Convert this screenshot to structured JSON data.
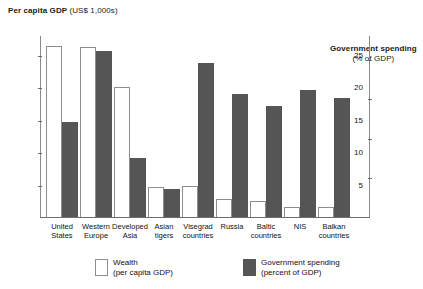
{
  "chart_data": {
    "type": "bar",
    "title": "",
    "categories": [
      "United States",
      "Western Europe",
      "Developed Asia",
      "Asian tigers",
      "Visegrad countries",
      "Russia",
      "Baltic countries",
      "NIS",
      "Balkan countries"
    ],
    "category_lines": [
      [
        "United",
        "States"
      ],
      [
        "Western",
        "Europe"
      ],
      [
        "Developed",
        "Asia"
      ],
      [
        "Asian",
        "tigers"
      ],
      [
        "Visegrad",
        "countries"
      ],
      [
        "Russia",
        ""
      ],
      [
        "Baltic",
        "countries"
      ],
      [
        "NIS",
        ""
      ],
      [
        "Balkan",
        "countries"
      ]
    ],
    "series": [
      {
        "name": "Wealth (per capita GDP)",
        "axis": "left",
        "color": "#ffffff",
        "values": [
          26.3,
          26.2,
          20.0,
          4.6,
          4.7,
          2.8,
          2.5,
          1.5,
          1.6
        ]
      },
      {
        "name": "Government spending (percent of GDP)",
        "axis": "right",
        "color": "#555555",
        "values": [
          34.0,
          52.0,
          25.0,
          17.0,
          49.0,
          41.0,
          38.0,
          42.0,
          40.0
        ]
      }
    ],
    "left_axis": {
      "label_line1": "Per capita GDP",
      "label_line2": "(US$ 1,000s)",
      "ticks": [
        5,
        10,
        15,
        20,
        25
      ],
      "min": 0,
      "max": 28
    },
    "right_axis": {
      "label_line1": "Government spending",
      "label_line2": "(% of GDP)",
      "ticks": [
        20,
        30,
        40,
        50
      ],
      "min": 10,
      "max": 56
    },
    "grid": false,
    "legend_position": "bottom"
  },
  "legend": {
    "wealth": {
      "line1": "Wealth",
      "line2": "(per capita GDP)"
    },
    "spending": {
      "line1": "Government spending",
      "line2": "(percent of GDP)"
    }
  }
}
